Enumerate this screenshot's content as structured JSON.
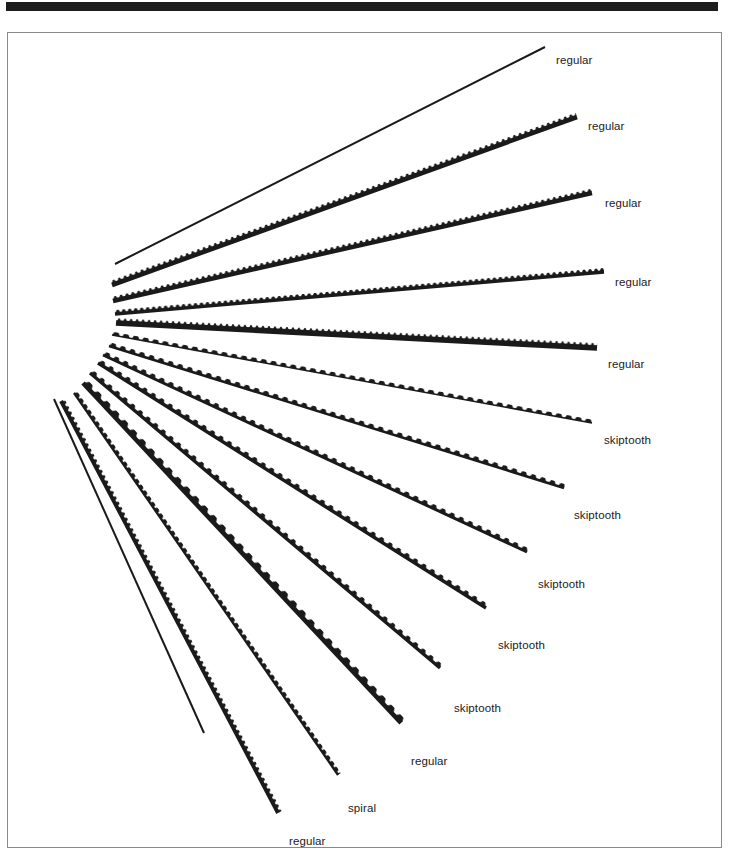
{
  "page": {
    "background_color": "#ffffff",
    "header_bar_color": "#1c1c1c",
    "frame_border_color": "#8a8a8a"
  },
  "figure": {
    "name": "scroll-saw-blade-fan",
    "blade_color": "#1a1a1a",
    "pivot": {
      "x": 110,
      "y": 258
    },
    "blade_count": 14,
    "blades": [
      {
        "index": 0,
        "label": "regular",
        "x1": 107,
        "y1": 231,
        "x2": 537,
        "y2": 14,
        "thickness": 2.0,
        "teeth": "none",
        "label_x": 548,
        "label_y": 22
      },
      {
        "index": 1,
        "label": "regular",
        "x1": 104,
        "y1": 252,
        "x2": 569,
        "y2": 84,
        "thickness": 4.6,
        "teeth": "fine",
        "label_x": 580,
        "label_y": 88
      },
      {
        "index": 2,
        "label": "regular",
        "x1": 105,
        "y1": 268,
        "x2": 584,
        "y2": 160,
        "thickness": 4.4,
        "teeth": "fine",
        "label_x": 597,
        "label_y": 165
      },
      {
        "index": 3,
        "label": "regular",
        "x1": 107,
        "y1": 281,
        "x2": 596,
        "y2": 239,
        "thickness": 3.4,
        "teeth": "fine",
        "label_x": 607,
        "label_y": 244
      },
      {
        "index": 4,
        "label": "regular",
        "x1": 108,
        "y1": 290,
        "x2": 589,
        "y2": 315,
        "thickness": 5.6,
        "teeth": "fine",
        "label_x": 600,
        "label_y": 326
      },
      {
        "index": 5,
        "label": "skiptooth",
        "x1": 104,
        "y1": 302,
        "x2": 584,
        "y2": 390,
        "thickness": 1.6,
        "teeth": "skip",
        "label_x": 596,
        "label_y": 402
      },
      {
        "index": 6,
        "label": "skiptooth",
        "x1": 101,
        "y1": 313,
        "x2": 556,
        "y2": 455,
        "thickness": 2.6,
        "teeth": "skip",
        "label_x": 566,
        "label_y": 477
      },
      {
        "index": 7,
        "label": "skiptooth",
        "x1": 95,
        "y1": 322,
        "x2": 519,
        "y2": 519,
        "thickness": 3.0,
        "teeth": "skip",
        "label_x": 530,
        "label_y": 546
      },
      {
        "index": 8,
        "label": "skiptooth",
        "x1": 90,
        "y1": 330,
        "x2": 478,
        "y2": 575,
        "thickness": 3.4,
        "teeth": "skip",
        "label_x": 490,
        "label_y": 607
      },
      {
        "index": 9,
        "label": "skiptooth",
        "x1": 82,
        "y1": 340,
        "x2": 432,
        "y2": 635,
        "thickness": 3.4,
        "teeth": "skip",
        "label_x": 446,
        "label_y": 670
      },
      {
        "index": 10,
        "label": "regular",
        "x1": 75,
        "y1": 350,
        "x2": 393,
        "y2": 690,
        "thickness": 4.6,
        "teeth": "coarse",
        "label_x": 403,
        "label_y": 723
      },
      {
        "index": 11,
        "label": "spiral",
        "x1": 66,
        "y1": 360,
        "x2": 330,
        "y2": 742,
        "thickness": 2.2,
        "teeth": "spiral",
        "label_x": 340,
        "label_y": 770
      },
      {
        "index": 12,
        "label": "regular",
        "x1": 53,
        "y1": 368,
        "x2": 270,
        "y2": 780,
        "thickness": 3.8,
        "teeth": "fine",
        "label_x": 281,
        "label_y": 803
      },
      {
        "index": 13,
        "label": "regular",
        "x1": 46,
        "y1": 366,
        "x2": 196,
        "y2": 700,
        "thickness": 2.0,
        "teeth": "none",
        "label_x": 0,
        "label_y": 0,
        "hide_label": true
      }
    ],
    "labels": [
      "regular",
      "regular",
      "regular",
      "regular",
      "regular",
      "skiptooth",
      "skiptooth",
      "skiptooth",
      "skiptooth",
      "skiptooth",
      "regular",
      "spiral",
      "regular"
    ]
  }
}
